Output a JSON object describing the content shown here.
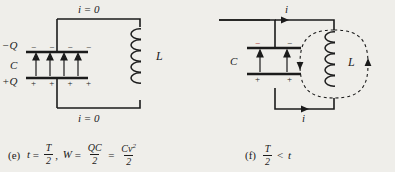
{
  "figure": {
    "type": "physics-circuit-diagram",
    "background_color": "#efeeea",
    "ink_color": "#1b1b1b"
  },
  "panel_e": {
    "id": "e",
    "top_wire_label": "i = 0",
    "bottom_wire_label": "i = 0",
    "capacitor": {
      "label": "C",
      "top_charge_label": "−Q",
      "bottom_charge_label": "+Q",
      "top_plate_signs": [
        "−",
        "−",
        "−",
        "−"
      ],
      "bottom_plate_signs": [
        "+",
        "+",
        "+",
        "+"
      ],
      "field_arrow_count": 4,
      "field_arrow_direction": "up"
    },
    "inductor": {
      "label": "L",
      "coil_turns": 5,
      "field_lines": "none"
    },
    "caption": {
      "tag": "(e)",
      "time_var": "t",
      "equals": "=",
      "period_num": "T",
      "period_den": "2",
      "comma": ",",
      "energy_var": "W",
      "energy_equals": "=",
      "term1_num": "QC",
      "term1_den": "2",
      "middle_equals": "=",
      "term2_num": "Cv",
      "term2_sup": "2",
      "term2_den": "2"
    }
  },
  "panel_f": {
    "id": "f",
    "top_wire_label": "i",
    "bottom_wire_label": "i",
    "top_current_direction": "right",
    "bottom_current_direction": "right",
    "capacitor": {
      "label": "C",
      "top_plate_signs": [
        "−",
        "−"
      ],
      "bottom_plate_signs": [
        "+",
        "+"
      ],
      "field_arrow_count": 2,
      "field_arrow_direction": "up"
    },
    "inductor": {
      "label": "L",
      "coil_turns": 5,
      "field_lines": "dashed-loops",
      "left_loop_arrow": "down",
      "right_loop_arrow": "up"
    },
    "caption": {
      "tag": "(f)",
      "period_num": "T",
      "period_den": "2",
      "relation": "<",
      "time_var": "t"
    }
  }
}
